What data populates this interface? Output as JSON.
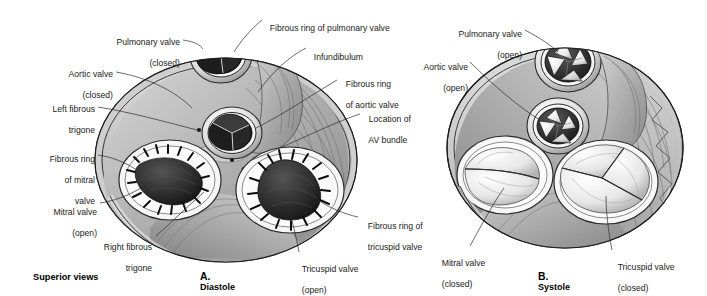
{
  "figure": {
    "title_note": "Superior views",
    "panels": [
      {
        "id": "A",
        "letter": "A.",
        "name": "Diastole"
      },
      {
        "id": "B",
        "letter": "B.",
        "name": "Systole"
      }
    ]
  },
  "panel_a": {
    "caption_letter": "A.",
    "caption_name": "Diastole",
    "labels": [
      {
        "name": "pulmonary-valve",
        "line1": "Pulmonary valve",
        "line2": "(closed)"
      },
      {
        "name": "aortic-valve",
        "line1": "Aortic valve",
        "line2": "(closed)"
      },
      {
        "name": "left-fibrous-trigone",
        "line1": "Left fibrous",
        "line2": "trigone"
      },
      {
        "name": "fibrous-ring-mitral-valve",
        "line1": "Fibrous ring",
        "line2": "of mitral",
        "line3": "valve"
      },
      {
        "name": "mitral-valve",
        "line1": "Mitral valve",
        "line2": "(open)"
      },
      {
        "name": "right-fibrous-trigone",
        "line1": "Right fibrous",
        "line2": "trigone"
      },
      {
        "name": "fibrous-ring-pulmonary-valve",
        "line1": "Fibrous ring of pulmonary valve"
      },
      {
        "name": "infundibulum",
        "line1": "Infundibulum"
      },
      {
        "name": "fibrous-ring-aortic-valve",
        "line1": "Fibrous ring",
        "line2": "of aortic valve"
      },
      {
        "name": "location-of-av-bundle",
        "line1": "Location of",
        "line2": "AV bundle"
      },
      {
        "name": "fibrous-ring-tricuspid-valve",
        "line1": "Fibrous ring of",
        "line2": "tricuspid valve"
      },
      {
        "name": "tricuspid-valve",
        "line1": "Tricuspid valve",
        "line2": "(open)"
      }
    ]
  },
  "panel_b": {
    "caption_letter": "B.",
    "caption_name": "Systole",
    "labels": [
      {
        "name": "pulmonary-valve",
        "line1": "Pulmonary valve",
        "line2": "(open)"
      },
      {
        "name": "aortic-valve",
        "line1": "Aortic valve",
        "line2": "(open)"
      },
      {
        "name": "mitral-valve",
        "line1": "Mitral valve",
        "line2": "(closed)"
      },
      {
        "name": "tricuspid-valve",
        "line1": "Tricuspid valve",
        "line2": "(closed)"
      }
    ]
  },
  "colors": {
    "background": "#ffffff",
    "outline": "#1c1c1c",
    "tissue_light": "#e3e3e3",
    "tissue_mid": "#b9b9b9",
    "tissue_dark": "#8d8d8d",
    "valve_dark": "#2e2e2e",
    "cusp_white": "#f4f4f4",
    "label_text": "#1a1a1a"
  }
}
